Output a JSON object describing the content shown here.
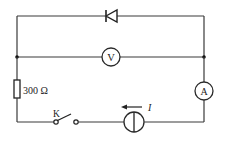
{
  "diagram": {
    "type": "electrical-circuit",
    "colors": {
      "line": "#3a3a3a",
      "background": "#ffffff"
    },
    "components": {
      "diode": {
        "label": "",
        "direction": "left"
      },
      "voltmeter": {
        "symbol": "V"
      },
      "ammeter": {
        "symbol": "A"
      },
      "resistor": {
        "label": "300 Ω"
      },
      "switch": {
        "label": "K",
        "state": "open"
      },
      "current_source": {
        "current_label": "I",
        "arrow_direction": "left"
      }
    },
    "nodes": [
      "left-junction",
      "right-junction"
    ]
  }
}
